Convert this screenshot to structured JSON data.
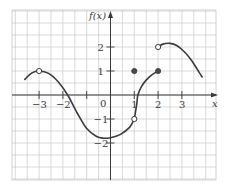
{
  "chart_data": {
    "type": "line",
    "title": "",
    "xlabel": "x",
    "ylabel": "f(x)",
    "xlim": [
      -4,
      4.3
    ],
    "ylim": [
      -3.5,
      3.6
    ],
    "grid": true,
    "grid_step": 0.5,
    "x_ticks": [
      -3,
      -2,
      -1,
      0,
      1,
      2,
      3
    ],
    "x_tick_labels": [
      "−3",
      "−2",
      "",
      "0",
      "1",
      "2",
      "3"
    ],
    "y_ticks": [
      -2,
      -1,
      1,
      2
    ],
    "y_tick_labels": [
      "−2",
      "−1",
      "1",
      "2"
    ],
    "origin_label": "0",
    "series": [
      {
        "name": "f(x) piece 1",
        "x": [
          -3.6,
          -3.3,
          -3,
          -2.6,
          -2.2,
          -1.8,
          -1.4,
          -1,
          -0.6,
          -0.3,
          0,
          0.4,
          0.8,
          1
        ],
        "y": [
          0.65,
          0.92,
          1.0,
          0.9,
          0.55,
          0.0,
          -0.75,
          -1.4,
          -1.72,
          -1.8,
          -1.78,
          -1.65,
          -1.35,
          -1.0
        ]
      },
      {
        "name": "f(x) piece 2",
        "x": [
          1,
          1.1,
          1.15,
          1.3,
          1.5,
          1.75,
          2
        ],
        "y": [
          -1.0,
          -0.4,
          0.0,
          0.35,
          0.62,
          0.85,
          1.0
        ]
      },
      {
        "name": "f(x) piece 3",
        "x": [
          2,
          2.2,
          2.5,
          2.8,
          3.1,
          3.4,
          3.85
        ],
        "y": [
          2.0,
          2.12,
          2.15,
          2.05,
          1.8,
          1.45,
          0.75
        ]
      }
    ],
    "points": [
      {
        "x": -3,
        "y": 1,
        "style": "open"
      },
      {
        "x": 1,
        "y": -1,
        "style": "open"
      },
      {
        "x": 1,
        "y": 1,
        "style": "filled"
      },
      {
        "x": 2,
        "y": 1,
        "style": "filled"
      },
      {
        "x": 2,
        "y": 2,
        "style": "open"
      }
    ]
  }
}
